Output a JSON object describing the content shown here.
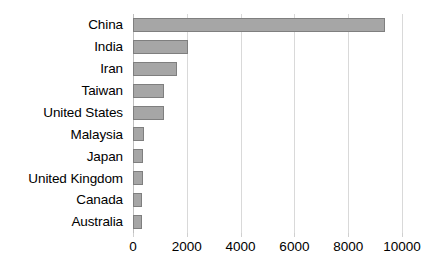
{
  "chart_data": {
    "type": "bar",
    "orientation": "horizontal",
    "title": "",
    "subtitle": "",
    "xlabel": "",
    "ylabel": "",
    "categories": [
      "China",
      "India",
      "Iran",
      "Taiwan",
      "United States",
      "Malaysia",
      "Japan",
      "United Kingdom",
      "Canada",
      "Australia"
    ],
    "values": [
      9370,
      2050,
      1640,
      1150,
      1150,
      420,
      380,
      370,
      330,
      330
    ],
    "series": [
      {
        "name": "",
        "values": [
          9370,
          2050,
          1640,
          1150,
          1150,
          420,
          380,
          370,
          330,
          330
        ]
      }
    ],
    "xlim": [
      0,
      10000
    ],
    "xticks": [
      0,
      2000,
      4000,
      6000,
      8000,
      10000
    ],
    "xtick_labels": [
      "0",
      "2000",
      "4000",
      "6000",
      "8000",
      "10000"
    ],
    "grid": true,
    "grid_axis": "x",
    "legend": false,
    "legend_position": "none",
    "annotations": []
  },
  "style": {
    "bar_fill": "#a6a6a6",
    "bar_border": "#7f7f7f",
    "gridline_color": "#d9d9d9",
    "axis_color": "#bfbfbf",
    "text_color": "#000000",
    "background": "#ffffff"
  }
}
